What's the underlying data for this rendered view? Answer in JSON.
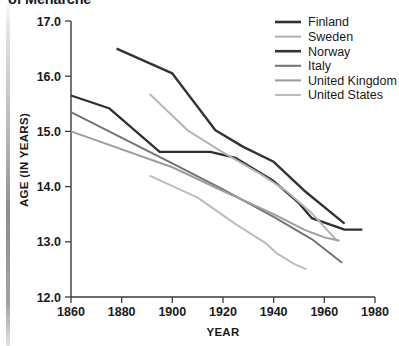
{
  "title": "of Menarche",
  "axes": {
    "x_label": "YEAR",
    "y_label": "AGE (IN YEARS)",
    "x_ticks": [
      "1860",
      "1880",
      "1900",
      "1920",
      "1940",
      "1960",
      "1980"
    ],
    "y_ticks": [
      "12.0",
      "13.0",
      "14.0",
      "15.0",
      "16.0",
      "17.0"
    ]
  },
  "legend": {
    "items": [
      {
        "label": "Finland",
        "color": "#2f2f2f"
      },
      {
        "label": "Sweden",
        "color": "#b5b5b5"
      },
      {
        "label": "Norway",
        "color": "#333333"
      },
      {
        "label": "Italy",
        "color": "#757575"
      },
      {
        "label": "United Kingdom",
        "color": "#9e9e9e"
      },
      {
        "label": "United States",
        "color": "#bdbdbd"
      }
    ]
  },
  "chart_data": {
    "type": "line",
    "title": "of Menarche",
    "xlabel": "YEAR",
    "ylabel": "AGE (IN YEARS)",
    "xlim": [
      1860,
      1980
    ],
    "ylim": [
      12.0,
      17.0
    ],
    "xticks": [
      1860,
      1880,
      1900,
      1920,
      1940,
      1960,
      1980
    ],
    "yticks": [
      12.0,
      13.0,
      14.0,
      15.0,
      16.0,
      17.0
    ],
    "grid": false,
    "legend_position": "top-right",
    "series": [
      {
        "name": "Finland",
        "color": "#2f2f2f",
        "points": [
          [
            1860,
            15.65
          ],
          [
            1875,
            15.42
          ],
          [
            1895,
            14.63
          ],
          [
            1915,
            14.63
          ],
          [
            1925,
            14.52
          ],
          [
            1940,
            14.1
          ],
          [
            1950,
            13.7
          ],
          [
            1955,
            13.43
          ],
          [
            1968,
            13.22
          ],
          [
            1975,
            13.22
          ]
        ]
      },
      {
        "name": "Sweden",
        "color": "#b5b5b5",
        "points": [
          [
            1891,
            15.68
          ],
          [
            1906,
            15.02
          ],
          [
            1920,
            14.62
          ],
          [
            1935,
            14.22
          ],
          [
            1945,
            13.92
          ],
          [
            1955,
            13.52
          ],
          [
            1965,
            13.02
          ]
        ]
      },
      {
        "name": "Norway",
        "color": "#333333",
        "points": [
          [
            1878,
            16.5
          ],
          [
            1900,
            16.05
          ],
          [
            1917,
            15.02
          ],
          [
            1928,
            14.72
          ],
          [
            1940,
            14.45
          ],
          [
            1952,
            13.93
          ],
          [
            1968,
            13.33
          ]
        ]
      },
      {
        "name": "Italy",
        "color": "#757575",
        "points": [
          [
            1860,
            15.35
          ],
          [
            1900,
            14.42
          ],
          [
            1920,
            13.95
          ],
          [
            1940,
            13.45
          ],
          [
            1955,
            13.05
          ],
          [
            1967,
            12.62
          ]
        ]
      },
      {
        "name": "United Kingdom",
        "color": "#9e9e9e",
        "points": [
          [
            1860,
            15.0
          ],
          [
            1900,
            14.35
          ],
          [
            1920,
            13.92
          ],
          [
            1940,
            13.5
          ],
          [
            1952,
            13.22
          ],
          [
            1960,
            13.08
          ],
          [
            1966,
            13.02
          ]
        ]
      },
      {
        "name": "United States",
        "color": "#bdbdbd",
        "points": [
          [
            1891,
            14.2
          ],
          [
            1910,
            13.8
          ],
          [
            1925,
            13.32
          ],
          [
            1937,
            12.97
          ],
          [
            1941,
            12.8
          ],
          [
            1948,
            12.6
          ],
          [
            1953,
            12.5
          ]
        ]
      }
    ]
  }
}
